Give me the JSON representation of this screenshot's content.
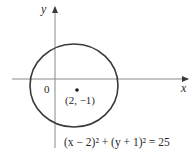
{
  "diagram": {
    "type": "circle-on-coordinate-plane",
    "axes": {
      "x_label": "x",
      "y_label": "y",
      "origin_label": "0"
    },
    "circle": {
      "center_label": "(2, −1)",
      "equation": "(x − 2)² + (y + 1)² = 25",
      "center": [
        2,
        -1
      ],
      "radius": 5
    },
    "colors": {
      "stroke": "#3a3a3a",
      "background": "#ffffff"
    }
  }
}
